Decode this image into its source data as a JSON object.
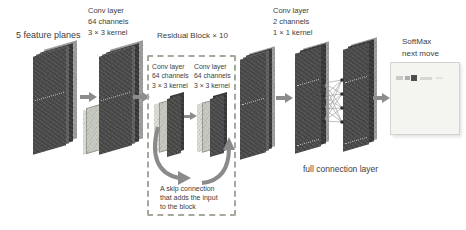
{
  "diagram": {
    "labels": {
      "input": "5 feature planes",
      "conv1": [
        "Conv layer",
        "64 channels",
        "3 × 3 kernel"
      ],
      "residual_block_title": "Residual Block × 10",
      "residual_conv_left": [
        "Conv layer",
        "64 channels",
        "3 × 3 kernel"
      ],
      "residual_conv_right": [
        "Conv layer",
        "64 channels",
        "3 × 3 kernel"
      ],
      "skip_note": [
        "A skip connection",
        "that adds the input",
        "to the block"
      ],
      "conv_output": [
        "Conv layer",
        "2 channels",
        "1 × 1 kernel"
      ],
      "full_connection": "full connection layer",
      "softmax": [
        "SoftMax",
        "next move"
      ]
    },
    "colors": {
      "plane_dark": "#4a4a4a",
      "plane_darker": "#383838",
      "plane_mid": "#5f5f5f",
      "plane_side_edge": "#9e9e9e",
      "kernel_plane_light": "#c7cbc1",
      "arrow": "#8c8c8c",
      "dashed_border": "#a5a99b",
      "text": "#3d3d3d",
      "board_background": "#f4f4f1",
      "board_border": "#d2d2cf",
      "board_peak_mark": "#4e4e4c"
    }
  }
}
